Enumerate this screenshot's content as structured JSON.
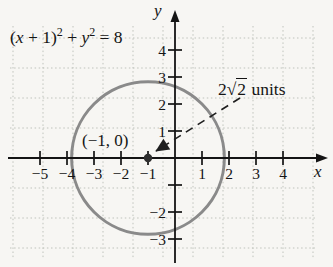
{
  "chart_data": {
    "type": "line",
    "subtype": "circle-on-coordinate-grid",
    "title": "",
    "equation_text": "(x + 1)² + y² = 8",
    "xlabel": "x",
    "ylabel": "y",
    "xlim": [
      -6,
      5.5
    ],
    "ylim": [
      -4,
      5.5
    ],
    "grid": true,
    "legend": "none",
    "circle": {
      "center_x": -1,
      "center_y": 0,
      "radius": 2.8284,
      "radius_expr": "2√2",
      "radius_label": "2√2 units",
      "center_label": "(−1, 0)"
    },
    "x_ticks": [
      {
        "v": -5,
        "label": "−5"
      },
      {
        "v": -4,
        "label": "−4"
      },
      {
        "v": -3,
        "label": "−3"
      },
      {
        "v": -2,
        "label": "−2"
      },
      {
        "v": -1,
        "label": "−1"
      },
      {
        "v": 1,
        "label": "1"
      },
      {
        "v": 2,
        "label": "2"
      },
      {
        "v": 3,
        "label": "3"
      },
      {
        "v": 4,
        "label": "4"
      }
    ],
    "y_ticks": [
      {
        "v": 4,
        "label": "4"
      },
      {
        "v": 3,
        "label": "3"
      },
      {
        "v": 2,
        "label": "2"
      },
      {
        "v": 1,
        "label": "1"
      },
      {
        "v": -1,
        "label": ""
      },
      {
        "v": -2,
        "label": "−2"
      },
      {
        "v": -3,
        "label": "−3"
      }
    ]
  },
  "labels": {
    "equation": {
      "o1": "(",
      "x": "x",
      "o2": " + 1)",
      "e1": "2",
      "o3": " + ",
      "y": "y",
      "e2": "2",
      "o4": " = 8"
    },
    "radius": {
      "coef": "2",
      "root": "√",
      "radicand": "2",
      "suffix": " units"
    },
    "center_point": "(−1, 0)",
    "x_axis": "x",
    "y_axis": "y"
  },
  "colors": {
    "background": "#f7f6f3",
    "grid": "#bfc3bc",
    "axis": "#141414",
    "text": "#141414",
    "circle": "#8a8a8a",
    "dashed": "#1e1e1e",
    "dot": "#2f2f2f"
  }
}
